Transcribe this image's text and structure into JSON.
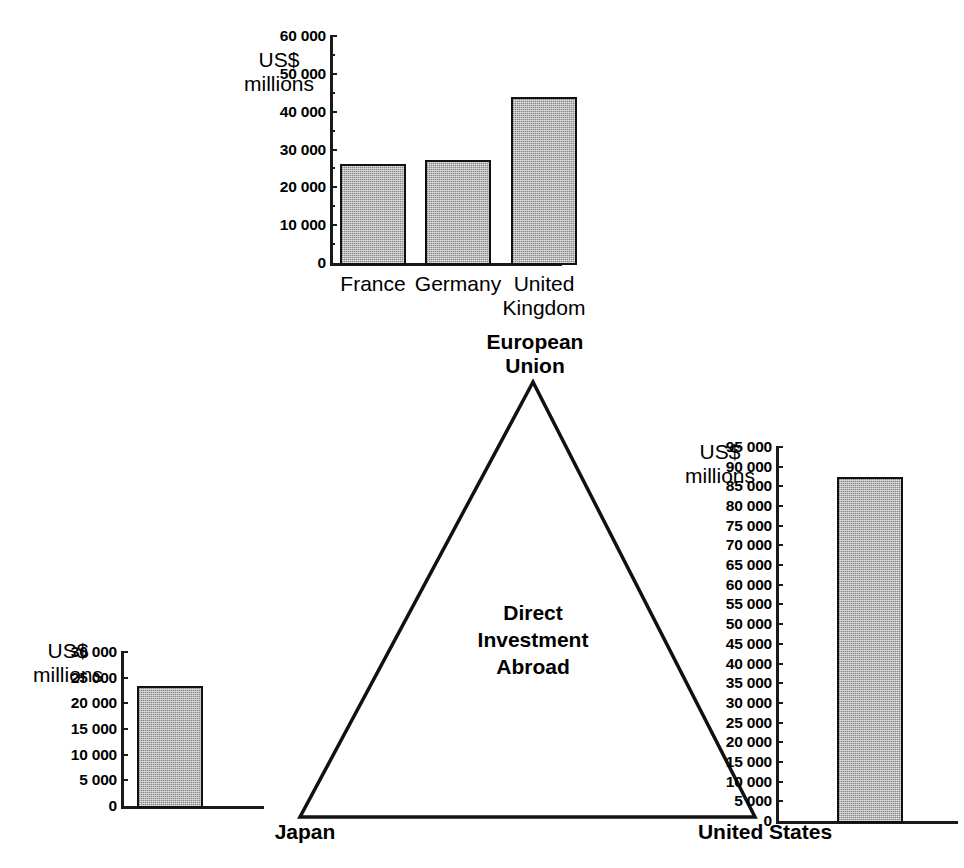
{
  "figure": {
    "center_label": "Direct\nInvestment\nAbroad",
    "nodes": {
      "top": "European\nUnion",
      "bottom_left": "Japan",
      "bottom_right": "United States"
    },
    "unit_label": "US$\nmillions",
    "caption": ""
  },
  "chart_data": [
    {
      "id": "european-union",
      "type": "bar",
      "title": "European Union",
      "categories": [
        "France",
        "Germany",
        "United\nKingdom"
      ],
      "values": [
        26200,
        27200,
        44000
      ],
      "ylabel": "US$ millions",
      "xlabel": "",
      "ylim": [
        0,
        60000
      ],
      "ytick_values": [
        0,
        10000,
        20000,
        30000,
        40000,
        50000,
        60000
      ],
      "ytick_labels": [
        "0",
        "10 000",
        "20 000",
        "30 000",
        "40 000",
        "50 000",
        "60 000"
      ],
      "minor_tick_step": 5000,
      "grid": false,
      "legend": "none"
    },
    {
      "id": "japan",
      "type": "bar",
      "title": "Japan",
      "categories": [
        "Japan"
      ],
      "values": [
        23300
      ],
      "ylabel": "US$ millions",
      "xlabel": "",
      "ylim": [
        0,
        30000
      ],
      "ytick_values": [
        0,
        5000,
        10000,
        15000,
        20000,
        25000,
        30000
      ],
      "ytick_labels": [
        "0",
        "5 000",
        "10 000",
        "15 000",
        "20 000",
        "25 000",
        "30 000"
      ],
      "minor_tick_step": 0,
      "grid": false,
      "legend": "none"
    },
    {
      "id": "united-states",
      "type": "bar",
      "title": "United States",
      "categories": [
        "United States"
      ],
      "values": [
        87500
      ],
      "ylabel": "US$ millions",
      "xlabel": "",
      "ylim": [
        0,
        95000
      ],
      "ytick_values": [
        0,
        5000,
        10000,
        15000,
        20000,
        25000,
        30000,
        35000,
        40000,
        45000,
        50000,
        55000,
        60000,
        65000,
        70000,
        75000,
        80000,
        85000,
        90000,
        95000
      ],
      "ytick_labels": [
        "0",
        "5 000",
        "10 000",
        "15 000",
        "20 000",
        "25 000",
        "30 000",
        "35 000",
        "40 000",
        "45 000",
        "50 000",
        "55 000",
        "60 000",
        "65 000",
        "70 000",
        "75 000",
        "80 000",
        "85 000",
        "90 000",
        "95 000"
      ],
      "minor_tick_step": 0,
      "grid": false,
      "legend": "none"
    }
  ],
  "colors": {
    "ink": "#111111",
    "bar_fill": "#b9b9b9",
    "background": "#ffffff"
  }
}
